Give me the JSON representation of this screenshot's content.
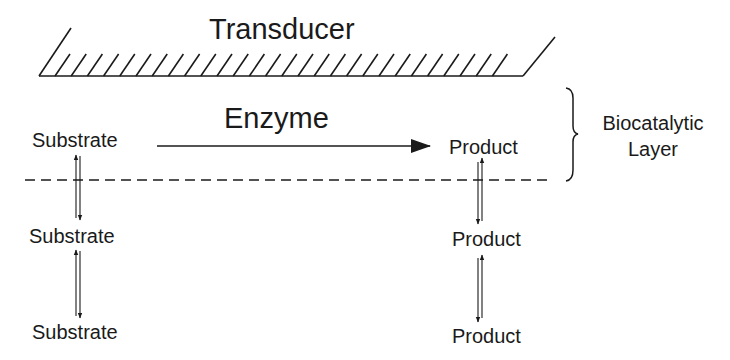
{
  "diagram": {
    "type": "enzyme-biosensor-schematic",
    "transducer": {
      "label": "Transducer"
    },
    "reaction": {
      "catalyst_label": "Enzyme",
      "from": "Substrate",
      "to": "Product"
    },
    "layer_label": {
      "line1": "Biocatalytic",
      "line2": "Layer"
    },
    "substrate_column": {
      "labels": [
        "Substrate",
        "Substrate",
        "Substrate"
      ]
    },
    "product_column": {
      "labels": [
        "Product",
        "Product",
        "Product"
      ]
    },
    "colors": {
      "ink": "#1a1a1a",
      "background": "#ffffff"
    }
  }
}
